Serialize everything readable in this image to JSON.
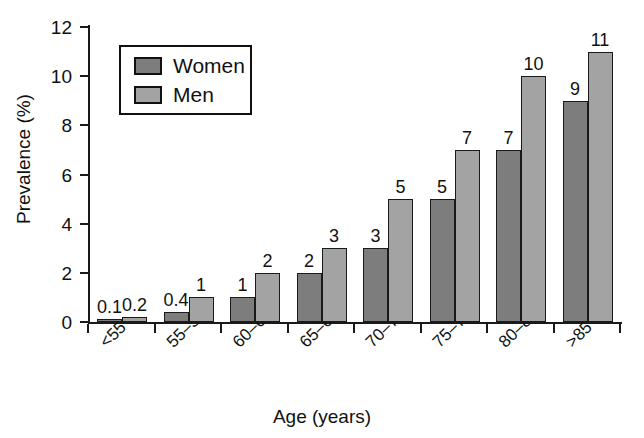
{
  "chart_data": {
    "type": "bar",
    "title": "",
    "xlabel": "Age (years)",
    "ylabel": "Prevalence (%)",
    "categories": [
      "<55",
      "55–59",
      "60–64",
      "65–69",
      "70–74",
      "75–79",
      "80–84",
      ">85"
    ],
    "series": [
      {
        "name": "Women",
        "color": "#7d7d7d",
        "values": [
          0.1,
          0.4,
          1,
          2,
          3,
          5,
          7,
          9
        ],
        "labels": [
          "0.1",
          "0.4",
          "1",
          "2",
          "3",
          "5",
          "7",
          "9"
        ]
      },
      {
        "name": "Men",
        "color": "#a3a3a3",
        "values": [
          0.2,
          1,
          2,
          3,
          5,
          7,
          10,
          11
        ],
        "labels": [
          "0.2",
          "1",
          "2",
          "3",
          "5",
          "7",
          "10",
          "11"
        ]
      }
    ],
    "ylim": [
      0,
      12
    ],
    "yticks": [
      0,
      2,
      4,
      6,
      8,
      10,
      12
    ],
    "ytick_labels": [
      "0",
      "2",
      "4",
      "6",
      "8",
      "10",
      "12"
    ],
    "grid": false,
    "legend_position": "upper-left-inside",
    "legend_entries": [
      "Women",
      "Men"
    ],
    "xtick_label_rotation": -45,
    "bar_outline_color": "#1a1a1a",
    "axis_color": "#1a1a1a",
    "background_color": "#ffffff"
  }
}
